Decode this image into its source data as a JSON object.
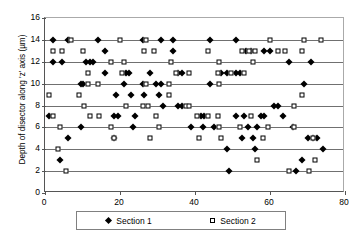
{
  "chart_data": {
    "type": "scatter",
    "title": "",
    "xlabel": "",
    "ylabel": "Depth of disector along 'z' axis (µm)",
    "xlim": [
      0,
      80
    ],
    "ylim": [
      0,
      16
    ],
    "xticks": [
      0,
      20,
      40,
      60,
      80
    ],
    "yticks": [
      0,
      2,
      4,
      6,
      8,
      10,
      12,
      14,
      16
    ],
    "grid": "horizontal",
    "legend_position": "bottom",
    "series": [
      {
        "name": "Section 1",
        "marker": "filled-diamond",
        "color": "#000000",
        "points": [
          [
            2,
            14
          ],
          [
            6,
            14
          ],
          [
            6.5,
            14
          ],
          [
            14,
            14
          ],
          [
            26,
            14
          ],
          [
            31,
            14
          ],
          [
            34,
            14
          ],
          [
            44,
            14
          ],
          [
            51,
            14
          ],
          [
            16,
            13
          ],
          [
            34,
            13
          ],
          [
            53.5,
            13
          ],
          [
            55,
            13
          ],
          [
            58.5,
            13
          ],
          [
            60,
            13
          ],
          [
            2,
            12
          ],
          [
            4.5,
            12
          ],
          [
            11,
            12
          ],
          [
            12,
            12
          ],
          [
            12.8,
            12
          ],
          [
            65,
            12
          ],
          [
            71,
            12
          ],
          [
            16,
            11
          ],
          [
            21.5,
            11
          ],
          [
            22.5,
            11
          ],
          [
            28,
            11
          ],
          [
            35.5,
            11
          ],
          [
            36.5,
            11
          ],
          [
            47,
            11
          ],
          [
            48.5,
            11
          ],
          [
            51,
            11
          ],
          [
            52,
            11
          ],
          [
            9.5,
            10
          ],
          [
            10,
            10
          ],
          [
            21,
            10
          ],
          [
            26,
            10
          ],
          [
            29.5,
            10
          ],
          [
            31,
            10
          ],
          [
            44,
            10
          ],
          [
            69,
            10
          ],
          [
            19,
            9
          ],
          [
            23,
            9
          ],
          [
            26.5,
            9
          ],
          [
            30.5,
            9
          ],
          [
            31.5,
            8
          ],
          [
            35.5,
            8
          ],
          [
            36.5,
            8
          ],
          [
            61,
            8
          ],
          [
            62,
            8
          ],
          [
            1,
            7
          ],
          [
            18.5,
            7
          ],
          [
            19.5,
            7
          ],
          [
            24,
            7
          ],
          [
            41.5,
            7
          ],
          [
            42.5,
            7
          ],
          [
            51,
            7
          ],
          [
            53,
            7
          ],
          [
            57.5,
            7
          ],
          [
            58.5,
            7
          ],
          [
            63.5,
            7
          ],
          [
            9.5,
            6
          ],
          [
            23.5,
            6
          ],
          [
            39,
            6
          ],
          [
            42,
            6
          ],
          [
            45,
            6
          ],
          [
            54,
            6
          ],
          [
            56.5,
            6
          ],
          [
            66,
            6
          ],
          [
            6,
            5
          ],
          [
            18.5,
            5
          ],
          [
            52.5,
            5
          ],
          [
            55.5,
            5
          ],
          [
            70,
            5
          ],
          [
            71.5,
            5
          ],
          [
            72.5,
            5
          ],
          [
            48.5,
            4
          ],
          [
            56,
            4
          ],
          [
            74,
            4
          ],
          [
            4,
            3
          ],
          [
            68.5,
            3
          ],
          [
            49,
            2
          ],
          [
            67,
            2
          ]
        ]
      },
      {
        "name": "Section 2",
        "marker": "open-square",
        "color": "#000000",
        "points": [
          [
            7,
            14
          ],
          [
            20,
            14
          ],
          [
            27,
            14
          ],
          [
            60,
            14
          ],
          [
            69,
            14
          ],
          [
            73.5,
            14
          ],
          [
            2,
            13
          ],
          [
            4.5,
            13
          ],
          [
            10,
            13
          ],
          [
            26.5,
            13
          ],
          [
            29,
            13
          ],
          [
            43.5,
            13
          ],
          [
            52.5,
            13
          ],
          [
            54.5,
            13
          ],
          [
            56,
            13
          ],
          [
            62,
            13
          ],
          [
            64,
            13
          ],
          [
            68.5,
            13
          ],
          [
            17.5,
            12
          ],
          [
            21,
            12
          ],
          [
            33.5,
            12
          ],
          [
            46.5,
            12
          ],
          [
            55.5,
            12
          ],
          [
            11.5,
            11
          ],
          [
            20.5,
            11
          ],
          [
            35,
            11
          ],
          [
            38.5,
            11
          ],
          [
            46,
            11
          ],
          [
            49.5,
            11
          ],
          [
            53,
            11
          ],
          [
            11.5,
            10
          ],
          [
            14,
            10
          ],
          [
            27,
            10
          ],
          [
            33,
            10
          ],
          [
            46.5,
            10
          ],
          [
            1,
            9
          ],
          [
            9,
            9
          ],
          [
            33,
            9
          ],
          [
            68.5,
            9
          ],
          [
            10.5,
            8
          ],
          [
            21.5,
            8
          ],
          [
            26,
            8
          ],
          [
            27.5,
            8
          ],
          [
            37.5,
            8
          ],
          [
            38.5,
            8
          ],
          [
            66.5,
            8
          ],
          [
            2,
            7
          ],
          [
            12,
            7
          ],
          [
            14.5,
            7
          ],
          [
            29.5,
            7
          ],
          [
            40.5,
            7
          ],
          [
            43.5,
            7
          ],
          [
            46,
            7
          ],
          [
            55,
            7
          ],
          [
            4,
            6
          ],
          [
            17.5,
            6
          ],
          [
            30.5,
            6
          ],
          [
            46.5,
            6
          ],
          [
            52,
            6
          ],
          [
            59.5,
            6
          ],
          [
            66.5,
            6
          ],
          [
            18.5,
            5
          ],
          [
            28,
            5
          ],
          [
            41,
            5
          ],
          [
            47,
            5
          ],
          [
            58,
            5
          ],
          [
            71.5,
            5
          ],
          [
            3.5,
            4
          ],
          [
            56.5,
            3
          ],
          [
            72,
            3
          ],
          [
            5.5,
            2
          ],
          [
            65,
            2
          ],
          [
            70.5,
            2
          ]
        ]
      }
    ]
  },
  "legend": {
    "items": [
      {
        "label": "Section 1",
        "marker": "filled-diamond"
      },
      {
        "label": "Section 2",
        "marker": "open-square"
      }
    ]
  },
  "axes": {
    "y_title": "Depth of disector along 'z' axis (µm)",
    "y_tick_labels": [
      "16",
      "14",
      "12",
      "10",
      "8",
      "6",
      "4",
      "2",
      "0"
    ],
    "x_tick_labels": [
      "0",
      "20",
      "40",
      "60",
      "80"
    ]
  }
}
